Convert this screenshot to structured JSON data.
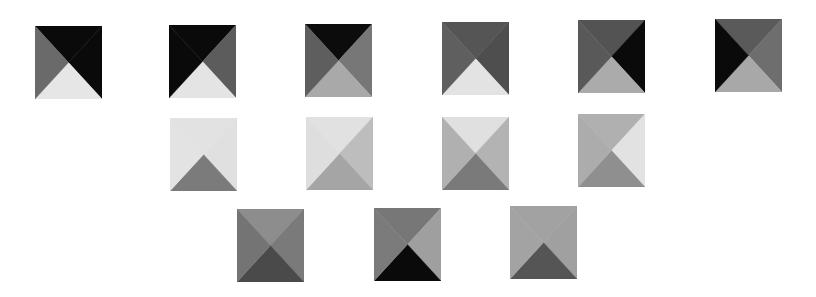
{
  "canvas": {
    "width": 816,
    "height": 297,
    "background": "#ffffff"
  },
  "tiles": [
    {
      "row": 1,
      "col": 1,
      "x": 35,
      "y": 26,
      "top": "#0a0a0a",
      "right": "#0a0a0a",
      "bottom": "#e6e6e6",
      "left": "#6a6a6a"
    },
    {
      "row": 1,
      "col": 2,
      "x": 169,
      "y": 25,
      "top": "#0a0a0a",
      "right": "#5c5c5c",
      "bottom": "#e4e4e4",
      "left": "#0a0a0a"
    },
    {
      "row": 1,
      "col": 3,
      "x": 305,
      "y": 24,
      "top": "#0c0c0c",
      "right": "#777777",
      "bottom": "#a9a9a9",
      "left": "#5e5e5e"
    },
    {
      "row": 1,
      "col": 4,
      "x": 442,
      "y": 22,
      "top": "#555555",
      "right": "#4e4e4e",
      "bottom": "#e3e3e3",
      "left": "#5f5f5f"
    },
    {
      "row": 1,
      "col": 5,
      "x": 578,
      "y": 20,
      "top": "#535353",
      "right": "#0a0a0a",
      "bottom": "#ababab",
      "left": "#595959"
    },
    {
      "row": 1,
      "col": 6,
      "x": 715,
      "y": 19,
      "top": "#5a5a5a",
      "right": "#6e6e6e",
      "bottom": "#a8a8a8",
      "left": "#0a0a0a"
    },
    {
      "row": 2,
      "col": 1,
      "x": 170,
      "y": 118,
      "top": "#e2e2e2",
      "right": "#e0e0e0",
      "bottom": "#7b7b7b",
      "left": "#e3e3e3"
    },
    {
      "row": 2,
      "col": 2,
      "x": 306,
      "y": 117,
      "top": "#e1e1e1",
      "right": "#bdbdbd",
      "bottom": "#a5a5a5",
      "left": "#dedede"
    },
    {
      "row": 2,
      "col": 3,
      "x": 442,
      "y": 117,
      "top": "#e0e0e0",
      "right": "#b3b3b3",
      "bottom": "#7a7a7a",
      "left": "#b0b0b0"
    },
    {
      "row": 2,
      "col": 4,
      "x": 578,
      "y": 114,
      "top": "#b0b0b0",
      "right": "#e2e2e2",
      "bottom": "#8f8f8f",
      "left": "#acacac"
    },
    {
      "row": 3,
      "col": 1,
      "x": 237,
      "y": 209,
      "top": "#8d8d8d",
      "right": "#7a7a7a",
      "bottom": "#4a4a4a",
      "left": "#747474"
    },
    {
      "row": 3,
      "col": 2,
      "x": 374,
      "y": 208,
      "top": "#777777",
      "right": "#9f9f9f",
      "bottom": "#0a0a0a",
      "left": "#7b7b7b"
    },
    {
      "row": 3,
      "col": 3,
      "x": 510,
      "y": 206,
      "top": "#a2a2a2",
      "right": "#a0a0a0",
      "bottom": "#555555",
      "left": "#a3a3a3"
    }
  ]
}
